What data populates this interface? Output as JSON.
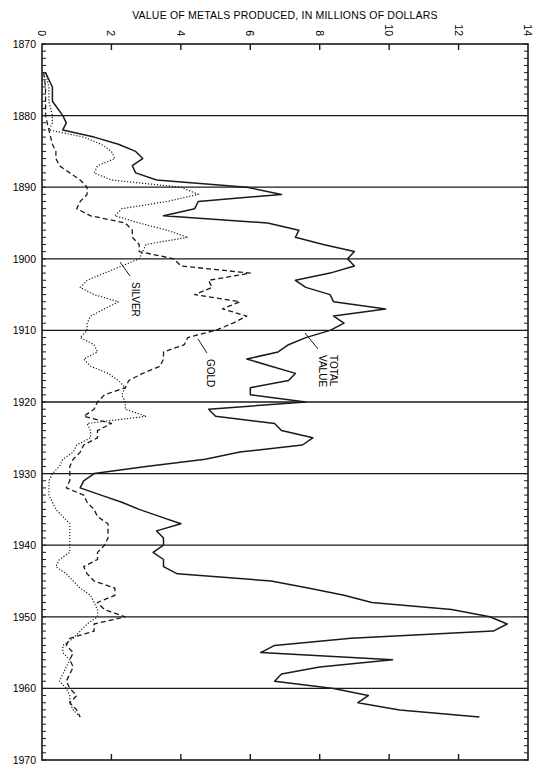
{
  "chart_data": {
    "type": "line",
    "title": "",
    "xlabel": "VALUE OF METALS PRODUCED, IN MILLIONS OF DOLLARS",
    "ylabel": "",
    "orientation": "rotated: years run vertically (top to bottom), values run horizontally",
    "value_axis": {
      "range": [
        0,
        14
      ],
      "ticks": [
        0,
        2,
        4,
        6,
        8,
        10,
        12,
        14
      ],
      "position": "top"
    },
    "year_axis": {
      "range": [
        1870,
        1970
      ],
      "ticks": [
        1870,
        1880,
        1890,
        1900,
        1910,
        1920,
        1930,
        1940,
        1950,
        1960,
        1970
      ],
      "minor_tick_every": 1
    },
    "grid": "horizontal lines at each decade",
    "legend": "inline labels with leader lines",
    "series": [
      {
        "name": "TOTAL VALUE",
        "style": "solid",
        "points": [
          [
            1874,
            0.1
          ],
          [
            1876,
            0.3
          ],
          [
            1878,
            0.3
          ],
          [
            1880,
            0.6
          ],
          [
            1881,
            0.7
          ],
          [
            1882,
            0.6
          ],
          [
            1883,
            1.5
          ],
          [
            1884,
            2.2
          ],
          [
            1885,
            2.7
          ],
          [
            1886,
            2.9
          ],
          [
            1887,
            2.6
          ],
          [
            1888,
            2.7
          ],
          [
            1889,
            3.3
          ],
          [
            1890,
            5.9
          ],
          [
            1891,
            6.9
          ],
          [
            1892,
            4.5
          ],
          [
            1893,
            4.4
          ],
          [
            1894,
            3.5
          ],
          [
            1895,
            6.5
          ],
          [
            1896,
            7.4
          ],
          [
            1897,
            7.3
          ],
          [
            1898,
            8.1
          ],
          [
            1899,
            9.0
          ],
          [
            1900,
            8.8
          ],
          [
            1901,
            9.0
          ],
          [
            1902,
            8.3
          ],
          [
            1903,
            7.3
          ],
          [
            1904,
            7.6
          ],
          [
            1905,
            8.3
          ],
          [
            1906,
            8.4
          ],
          [
            1907,
            9.9
          ],
          [
            1908,
            8.4
          ],
          [
            1909,
            8.7
          ],
          [
            1910,
            8.3
          ],
          [
            1911,
            7.6
          ],
          [
            1912,
            7.1
          ],
          [
            1913,
            6.8
          ],
          [
            1914,
            5.9
          ],
          [
            1915,
            6.6
          ],
          [
            1916,
            7.3
          ],
          [
            1917,
            7.1
          ],
          [
            1918,
            6.0
          ],
          [
            1919,
            6.0
          ],
          [
            1920,
            7.6
          ],
          [
            1921,
            4.8
          ],
          [
            1922,
            5.0
          ],
          [
            1923,
            6.7
          ],
          [
            1924,
            6.9
          ],
          [
            1925,
            7.8
          ],
          [
            1926,
            7.5
          ],
          [
            1927,
            5.7
          ],
          [
            1928,
            4.7
          ],
          [
            1929,
            3.0
          ],
          [
            1930,
            1.5
          ],
          [
            1931,
            1.2
          ],
          [
            1932,
            1.1
          ],
          [
            1933,
            1.7
          ],
          [
            1934,
            2.3
          ],
          [
            1935,
            2.8
          ],
          [
            1936,
            3.4
          ],
          [
            1937,
            4.0
          ],
          [
            1938,
            3.3
          ],
          [
            1939,
            3.5
          ],
          [
            1940,
            3.5
          ],
          [
            1941,
            3.2
          ],
          [
            1942,
            3.5
          ],
          [
            1943,
            3.5
          ],
          [
            1944,
            3.9
          ],
          [
            1945,
            6.6
          ],
          [
            1946,
            7.7
          ],
          [
            1947,
            8.7
          ],
          [
            1948,
            9.5
          ],
          [
            1949,
            11.8
          ],
          [
            1950,
            12.9
          ],
          [
            1951,
            13.4
          ],
          [
            1952,
            13.0
          ],
          [
            1953,
            8.9
          ],
          [
            1954,
            6.7
          ],
          [
            1955,
            6.3
          ],
          [
            1956,
            10.1
          ],
          [
            1957,
            8.0
          ],
          [
            1958,
            6.9
          ],
          [
            1959,
            6.7
          ],
          [
            1960,
            8.4
          ],
          [
            1961,
            9.4
          ],
          [
            1962,
            9.1
          ],
          [
            1963,
            10.3
          ],
          [
            1964,
            12.6
          ]
        ]
      },
      {
        "name": "GOLD",
        "style": "dashed",
        "points": [
          [
            1874,
            0.05
          ],
          [
            1876,
            0.1
          ],
          [
            1878,
            0.1
          ],
          [
            1880,
            0.1
          ],
          [
            1882,
            0.2
          ],
          [
            1884,
            0.3
          ],
          [
            1885,
            0.4
          ],
          [
            1886,
            0.4
          ],
          [
            1887,
            0.5
          ],
          [
            1888,
            0.8
          ],
          [
            1889,
            1.1
          ],
          [
            1890,
            1.3
          ],
          [
            1891,
            1.3
          ],
          [
            1892,
            1.1
          ],
          [
            1893,
            1.0
          ],
          [
            1894,
            1.4
          ],
          [
            1895,
            2.4
          ],
          [
            1896,
            2.6
          ],
          [
            1897,
            2.6
          ],
          [
            1898,
            2.8
          ],
          [
            1899,
            2.8
          ],
          [
            1900,
            3.8
          ],
          [
            1901,
            4.0
          ],
          [
            1902,
            6.0
          ],
          [
            1903,
            4.8
          ],
          [
            1904,
            4.9
          ],
          [
            1905,
            4.4
          ],
          [
            1906,
            5.7
          ],
          [
            1907,
            5.2
          ],
          [
            1908,
            5.9
          ],
          [
            1909,
            5.5
          ],
          [
            1910,
            5.0
          ],
          [
            1911,
            4.2
          ],
          [
            1912,
            4.1
          ],
          [
            1913,
            3.5
          ],
          [
            1914,
            3.5
          ],
          [
            1915,
            3.4
          ],
          [
            1916,
            2.9
          ],
          [
            1917,
            2.5
          ],
          [
            1918,
            2.4
          ],
          [
            1919,
            1.8
          ],
          [
            1920,
            1.6
          ],
          [
            1921,
            1.5
          ],
          [
            1922,
            1.2
          ],
          [
            1923,
            2.0
          ],
          [
            1924,
            1.6
          ],
          [
            1925,
            1.6
          ],
          [
            1926,
            1.2
          ],
          [
            1927,
            1.1
          ],
          [
            1928,
            0.9
          ],
          [
            1929,
            0.8
          ],
          [
            1930,
            0.8
          ],
          [
            1931,
            0.8
          ],
          [
            1932,
            0.7
          ],
          [
            1933,
            1.2
          ],
          [
            1934,
            1.3
          ],
          [
            1935,
            1.5
          ],
          [
            1936,
            1.6
          ],
          [
            1937,
            1.9
          ],
          [
            1938,
            1.9
          ],
          [
            1939,
            1.9
          ],
          [
            1940,
            1.8
          ],
          [
            1941,
            1.6
          ],
          [
            1942,
            1.6
          ],
          [
            1943,
            1.2
          ],
          [
            1944,
            1.3
          ],
          [
            1945,
            1.5
          ],
          [
            1946,
            2.1
          ],
          [
            1947,
            2.1
          ],
          [
            1948,
            1.6
          ],
          [
            1949,
            1.8
          ],
          [
            1950,
            2.4
          ],
          [
            1951,
            1.5
          ],
          [
            1952,
            1.5
          ],
          [
            1953,
            0.8
          ],
          [
            1954,
            0.7
          ],
          [
            1955,
            0.9
          ],
          [
            1956,
            0.8
          ],
          [
            1957,
            0.9
          ],
          [
            1958,
            0.8
          ],
          [
            1959,
            0.7
          ],
          [
            1960,
            0.8
          ],
          [
            1961,
            1.0
          ],
          [
            1962,
            0.8
          ],
          [
            1963,
            1.0
          ],
          [
            1964,
            1.1
          ]
        ]
      },
      {
        "name": "SILVER",
        "style": "dotted",
        "points": [
          [
            1874,
            0.1
          ],
          [
            1876,
            0.2
          ],
          [
            1878,
            0.2
          ],
          [
            1880,
            0.3
          ],
          [
            1881,
            0.3
          ],
          [
            1882,
            0.2
          ],
          [
            1883,
            1.2
          ],
          [
            1884,
            1.7
          ],
          [
            1885,
            2.0
          ],
          [
            1886,
            2.1
          ],
          [
            1887,
            1.6
          ],
          [
            1888,
            1.5
          ],
          [
            1889,
            2.0
          ],
          [
            1890,
            4.0
          ],
          [
            1891,
            4.5
          ],
          [
            1892,
            3.6
          ],
          [
            1893,
            2.3
          ],
          [
            1894,
            2.1
          ],
          [
            1895,
            2.8
          ],
          [
            1896,
            3.6
          ],
          [
            1897,
            4.2
          ],
          [
            1898,
            3.0
          ],
          [
            1899,
            2.9
          ],
          [
            1900,
            2.8
          ],
          [
            1901,
            2.3
          ],
          [
            1902,
            1.8
          ],
          [
            1903,
            1.3
          ],
          [
            1904,
            1.1
          ],
          [
            1905,
            1.5
          ],
          [
            1906,
            2.2
          ],
          [
            1907,
            1.8
          ],
          [
            1908,
            1.4
          ],
          [
            1909,
            1.3
          ],
          [
            1910,
            1.3
          ],
          [
            1911,
            1.1
          ],
          [
            1912,
            1.5
          ],
          [
            1913,
            1.6
          ],
          [
            1914,
            1.2
          ],
          [
            1915,
            1.4
          ],
          [
            1916,
            1.9
          ],
          [
            1917,
            2.2
          ],
          [
            1918,
            2.4
          ],
          [
            1919,
            2.3
          ],
          [
            1920,
            2.4
          ],
          [
            1921,
            2.4
          ],
          [
            1922,
            3.0
          ],
          [
            1923,
            1.3
          ],
          [
            1924,
            1.4
          ],
          [
            1925,
            1.4
          ],
          [
            1926,
            1.0
          ],
          [
            1927,
            0.9
          ],
          [
            1928,
            0.6
          ],
          [
            1929,
            0.5
          ],
          [
            1930,
            0.3
          ],
          [
            1931,
            0.2
          ],
          [
            1932,
            0.2
          ],
          [
            1933,
            0.2
          ],
          [
            1934,
            0.3
          ],
          [
            1935,
            0.4
          ],
          [
            1936,
            0.6
          ],
          [
            1937,
            0.8
          ],
          [
            1938,
            0.8
          ],
          [
            1939,
            0.8
          ],
          [
            1940,
            0.8
          ],
          [
            1941,
            0.8
          ],
          [
            1942,
            0.5
          ],
          [
            1943,
            0.4
          ],
          [
            1944,
            0.7
          ],
          [
            1945,
            0.9
          ],
          [
            1946,
            1.1
          ],
          [
            1947,
            1.4
          ],
          [
            1948,
            1.5
          ],
          [
            1949,
            1.6
          ],
          [
            1950,
            1.6
          ],
          [
            1951,
            1.3
          ],
          [
            1952,
            1.1
          ],
          [
            1953,
            0.9
          ],
          [
            1954,
            0.6
          ],
          [
            1955,
            0.6
          ],
          [
            1956,
            0.8
          ],
          [
            1957,
            0.7
          ],
          [
            1958,
            0.6
          ],
          [
            1959,
            0.5
          ],
          [
            1960,
            0.7
          ],
          [
            1961,
            0.8
          ],
          [
            1962,
            0.8
          ],
          [
            1963,
            0.9
          ],
          [
            1964,
            1.1
          ]
        ]
      }
    ],
    "annotations": [
      {
        "text": "SILVER",
        "near_year": 1904,
        "near_value": 2.5
      },
      {
        "text": "GOLD",
        "near_year": 1914,
        "near_value": 4.7
      },
      {
        "text": "TOTAL",
        "near_year": 1913,
        "near_value": 8.4
      },
      {
        "text": "VALUE",
        "near_year": 1913,
        "near_value": 8.0
      }
    ]
  },
  "labels": {
    "axis_title": "VALUE OF METALS PRODUCED, IN MILLIONS OF DOLLARS",
    "silver": "SILVER",
    "gold": "GOLD",
    "total_1": "TOTAL",
    "total_2": "VALUE"
  }
}
